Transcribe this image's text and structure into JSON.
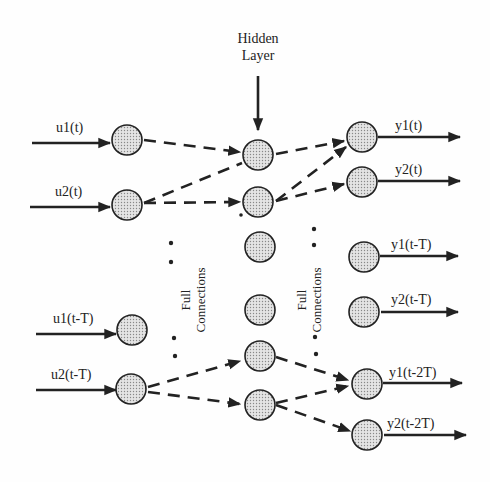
{
  "diagram": {
    "title": "Hidden Layer",
    "title_lines": [
      "Hidden",
      "Layer"
    ],
    "connection_labels": [
      {
        "lines": [
          "Full",
          "Connections"
        ],
        "position": "input-to-hidden"
      },
      {
        "lines": [
          "Full",
          "Connections"
        ],
        "position": "hidden-to-output"
      }
    ],
    "inputs": [
      {
        "label": "u1(t)",
        "x": 127,
        "y": 140
      },
      {
        "label": "u2(t)",
        "x": 127,
        "y": 205
      },
      {
        "label": "u1(t-T)",
        "x": 132,
        "y": 330
      },
      {
        "label": "u2(t-T)",
        "x": 131,
        "y": 389
      }
    ],
    "hidden": [
      {
        "x": 258,
        "y": 155
      },
      {
        "x": 258,
        "y": 202
      },
      {
        "x": 258,
        "y": 247
      },
      {
        "x": 258,
        "y": 310
      },
      {
        "x": 258,
        "y": 356
      },
      {
        "x": 258,
        "y": 405
      }
    ],
    "outputs": [
      {
        "label": "y1(t)",
        "x": 362,
        "y": 137
      },
      {
        "label": "y2(t)",
        "x": 362,
        "y": 182
      },
      {
        "label": "y1(t-T)",
        "x": 364,
        "y": 257
      },
      {
        "label": "y2(t-T)",
        "x": 364,
        "y": 312
      },
      {
        "label": "y1(t-2T)",
        "x": 367,
        "y": 384
      },
      {
        "label": "y2(t-2T)",
        "x": 367,
        "y": 435
      }
    ]
  }
}
